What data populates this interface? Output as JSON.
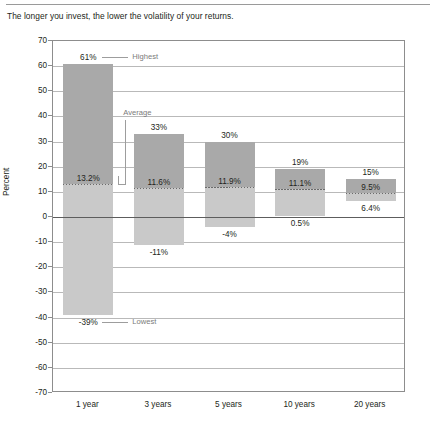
{
  "chart_data": {
    "type": "bar",
    "title": "The longer you invest, the lower the volatility of your returns.",
    "xlabel": "",
    "ylabel": "Percent",
    "ylim": [
      -70,
      70
    ],
    "ytick_step": 10,
    "yticks": [
      "70",
      "60",
      "50",
      "40",
      "30",
      "20",
      "10",
      "0",
      "-10",
      "-20",
      "-30",
      "-40",
      "-50",
      "-60",
      "-70"
    ],
    "grid": true,
    "legend": "none",
    "categories": [
      "1 year",
      "3 years",
      "5 years",
      "10 years",
      "20 years"
    ],
    "series": [
      {
        "name": "Highest",
        "values": [
          61,
          33,
          30,
          19,
          15
        ]
      },
      {
        "name": "Average",
        "values": [
          13.2,
          11.6,
          11.9,
          11.1,
          9.5
        ]
      },
      {
        "name": "Lowest",
        "values": [
          -39,
          -11,
          -4,
          0.5,
          6.4
        ]
      }
    ],
    "bars": [
      {
        "category": "1 year",
        "high": 61,
        "avg": 13.2,
        "low": -39,
        "high_label": "61%",
        "avg_label": "13.2%",
        "low_label": "-39%"
      },
      {
        "category": "3 years",
        "high": 33,
        "avg": 11.6,
        "low": -11,
        "high_label": "33%",
        "avg_label": "11.6%",
        "low_label": "-11%"
      },
      {
        "category": "5 years",
        "high": 30,
        "avg": 11.9,
        "low": -4,
        "high_label": "30%",
        "avg_label": "11.9%",
        "low_label": "-4%"
      },
      {
        "category": "10 years",
        "high": 19,
        "avg": 11.1,
        "low": 0.5,
        "high_label": "19%",
        "avg_label": "11.1%",
        "low_label": "0.5%"
      },
      {
        "category": "20 years",
        "high": 15,
        "avg": 9.5,
        "low": 6.4,
        "high_label": "15%",
        "avg_label": "9.5%",
        "low_label": "6.4%"
      }
    ],
    "annotations": [
      {
        "name": "highest",
        "label": "Highest"
      },
      {
        "name": "average",
        "label": "Average"
      },
      {
        "name": "lowest",
        "label": "Lowest"
      }
    ],
    "colors": {
      "bar_upper": "#a9a9a9",
      "bar_lower": "#c9c9c9",
      "gridline": "#b9b9b9",
      "zeroline": "#5d5d5d",
      "frame": "#8d8d8d",
      "text": "#231f20",
      "annotation": "#7a7a7a",
      "background": "#ffffff"
    }
  }
}
